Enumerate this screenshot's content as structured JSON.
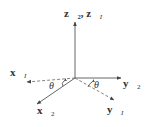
{
  "diagram": {
    "type": "coordinate-frame-rotation",
    "axes": [
      {
        "id": "z",
        "label": "z⃗₂, z⃗",
        "subscript_extra": "I",
        "style": "solid"
      },
      {
        "id": "y2",
        "label": "y⃗",
        "subscript": "2",
        "style": "solid"
      },
      {
        "id": "yI",
        "label": "y⃗",
        "subscript": "I",
        "style": "dashed"
      },
      {
        "id": "xI",
        "label": "x⃗",
        "subscript": "I",
        "style": "dashed"
      },
      {
        "id": "x2",
        "label": "x⃗",
        "subscript": "2",
        "style": "solid"
      }
    ],
    "angles": [
      {
        "id": "theta-left",
        "label": "θ"
      },
      {
        "id": "theta-right",
        "label": "θ"
      }
    ],
    "colors": {
      "line": "#555555",
      "text": "#333333",
      "background": "#ffffff"
    }
  }
}
